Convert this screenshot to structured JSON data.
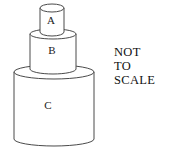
{
  "figure": {
    "background_color": "#ffffff",
    "outline_color": "#4a4a4a",
    "fill_color": "#ffffff",
    "label_color": "#1a1a1a"
  },
  "cylinders": [
    {
      "id": "A",
      "label": "A",
      "position": "top",
      "relative_size": "smallest",
      "geometry": {
        "cx": 52,
        "top_y": 8,
        "bottom_y": 32,
        "rx": 12,
        "ry": 4
      }
    },
    {
      "id": "B",
      "label": "B",
      "position": "middle",
      "relative_size": "medium",
      "geometry": {
        "cx": 53,
        "top_y": 34,
        "bottom_y": 69,
        "rx": 23,
        "ry": 5
      }
    },
    {
      "id": "C",
      "label": "C",
      "position": "bottom",
      "relative_size": "largest",
      "geometry": {
        "cx": 54,
        "top_y": 72,
        "bottom_y": 139,
        "rx": 40,
        "ry": 7
      }
    }
  ],
  "note": {
    "name": "not-to-scale-note",
    "lines": [
      "NOT",
      "TO",
      "SCALE"
    ],
    "line1": "NOT",
    "line2": "TO",
    "line3": "SCALE",
    "full_text": "NOT TO SCALE"
  }
}
